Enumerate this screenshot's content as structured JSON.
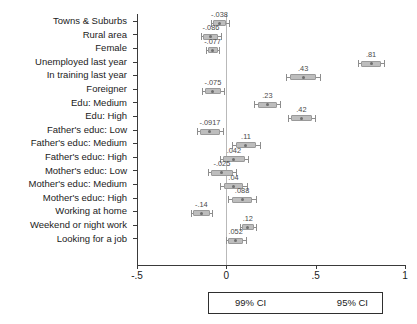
{
  "chart_data": {
    "type": "scatter",
    "subtype": "coefficient-forest-plot",
    "title": "",
    "subtitle": "",
    "xlabel": "",
    "ylabel": "",
    "xlim": [
      -0.5,
      1.0
    ],
    "xticks": [
      -0.5,
      0,
      0.5,
      1
    ],
    "xticklabels": [
      "-.5",
      "0",
      ".5",
      "1"
    ],
    "grid": false,
    "reference_line": 0,
    "legend_position": "bottom",
    "legend_entries": [
      "99% CI",
      "95% CI"
    ],
    "orientation": "horizontal",
    "categories": [
      "Towns & Suburbs",
      "Rural area",
      "Female",
      "Unemployed last year",
      "In training last year",
      "Foreigner",
      "Edu: Medium",
      "Edu: High",
      "Father's educ: Low",
      "Father's educ: Medium",
      "Father's educ: High",
      "Mother's educ: Low",
      "Mother's educ: Medium",
      "Mother's educ: High",
      "Working at home",
      "Weekend or night work",
      "Looking for a job"
    ],
    "values": [
      -0.038,
      -0.086,
      -0.077,
      0.81,
      0.43,
      -0.075,
      0.23,
      0.42,
      -0.0917,
      0.11,
      0.042,
      -0.025,
      0.04,
      0.088,
      -0.14,
      0.12,
      0.052
    ],
    "value_labels": [
      "-.038",
      "-.086",
      "-.077",
      ".81",
      ".43",
      "-.075",
      ".23",
      ".42",
      "-.0917",
      ".11",
      ".042",
      "-.025",
      ".04",
      ".088",
      "-.14",
      ".12",
      ".052"
    ],
    "points": [
      {
        "label": "Towns & Suburbs",
        "value": -0.038,
        "value_label": "-.038",
        "ci99": [
          -0.075,
          0.0
        ],
        "ci95": [
          -0.088,
          0.013
        ],
        "row": 0
      },
      {
        "label": "Rural area",
        "value": -0.086,
        "value_label": "-.086",
        "ci99": [
          -0.128,
          -0.044
        ],
        "ci95": [
          -0.14,
          -0.032
        ],
        "row": 1
      },
      {
        "label": "Female",
        "value": -0.077,
        "value_label": "-.077",
        "ci99": [
          -0.105,
          -0.049
        ],
        "ci95": [
          -0.113,
          -0.041
        ],
        "row": 2
      },
      {
        "label": "Unemployed last year",
        "value": 0.81,
        "value_label": ".81",
        "ci99": [
          0.755,
          0.865
        ],
        "ci95": [
          0.737,
          0.883
        ],
        "row": 3
      },
      {
        "label": "In training last year",
        "value": 0.43,
        "value_label": ".43",
        "ci99": [
          0.358,
          0.502
        ],
        "ci95": [
          0.336,
          0.524
        ],
        "row": 4
      },
      {
        "label": "Foreigner",
        "value": -0.075,
        "value_label": "-.075",
        "ci99": [
          -0.122,
          -0.028
        ],
        "ci95": [
          -0.136,
          -0.014
        ],
        "row": 5
      },
      {
        "label": "Edu: Medium",
        "value": 0.23,
        "value_label": ".23",
        "ci99": [
          0.175,
          0.285
        ],
        "ci95": [
          0.157,
          0.303
        ],
        "row": 6
      },
      {
        "label": "Edu: High",
        "value": 0.42,
        "value_label": ".42",
        "ci99": [
          0.362,
          0.478
        ],
        "ci95": [
          0.344,
          0.496
        ],
        "row": 7
      },
      {
        "label": "Father's educ: Low",
        "value": -0.0917,
        "value_label": "-.0917",
        "ci99": [
          -0.148,
          -0.036
        ],
        "ci95": [
          -0.166,
          -0.018
        ],
        "row": 8
      },
      {
        "label": "Father's educ: Medium",
        "value": 0.11,
        "value_label": ".11",
        "ci99": [
          0.055,
          0.165
        ],
        "ci95": [
          0.034,
          0.186
        ],
        "row": 9
      },
      {
        "label": "Father's educ: High",
        "value": 0.042,
        "value_label": ".042",
        "ci99": [
          -0.018,
          0.102
        ],
        "ci95": [
          -0.038,
          0.122
        ],
        "row": 10
      },
      {
        "label": "Mother's educ: Low",
        "value": -0.025,
        "value_label": "-.025",
        "ci99": [
          -0.085,
          0.035
        ],
        "ci95": [
          -0.105,
          0.055
        ],
        "row": 11
      },
      {
        "label": "Mother's educ: Medium",
        "value": 0.04,
        "value_label": ".04",
        "ci99": [
          -0.015,
          0.095
        ],
        "ci95": [
          -0.034,
          0.114
        ],
        "row": 12
      },
      {
        "label": "Mother's educ: High",
        "value": 0.088,
        "value_label": ".088",
        "ci99": [
          0.03,
          0.146
        ],
        "ci95": [
          0.011,
          0.165
        ],
        "row": 13
      },
      {
        "label": "Working at home",
        "value": -0.14,
        "value_label": "-.14",
        "ci99": [
          -0.186,
          -0.094
        ],
        "ci95": [
          -0.2,
          -0.08
        ],
        "row": 14
      },
      {
        "label": "Weekend or night work",
        "value": 0.12,
        "value_label": ".12",
        "ci99": [
          0.086,
          0.154
        ],
        "ci95": [
          0.075,
          0.165
        ],
        "row": 15
      },
      {
        "label": "Looking for a job",
        "value": 0.052,
        "value_label": ".052",
        "ci99": [
          0.01,
          0.094
        ],
        "ci95": [
          -0.004,
          0.108
        ],
        "row": 16
      }
    ],
    "colors": {
      "ci99_fill": "#bdbdbd",
      "ci99_border": "#9a9a9a",
      "ci95_line": "#8d8d8d",
      "marker": "#6f6f6f",
      "axis": "#3a3a3a",
      "reference_line": "#b9b9b9",
      "text": "#1b1b1b"
    }
  },
  "legend": {
    "ci99_label": "99% CI",
    "ci95_label": "95% CI"
  }
}
